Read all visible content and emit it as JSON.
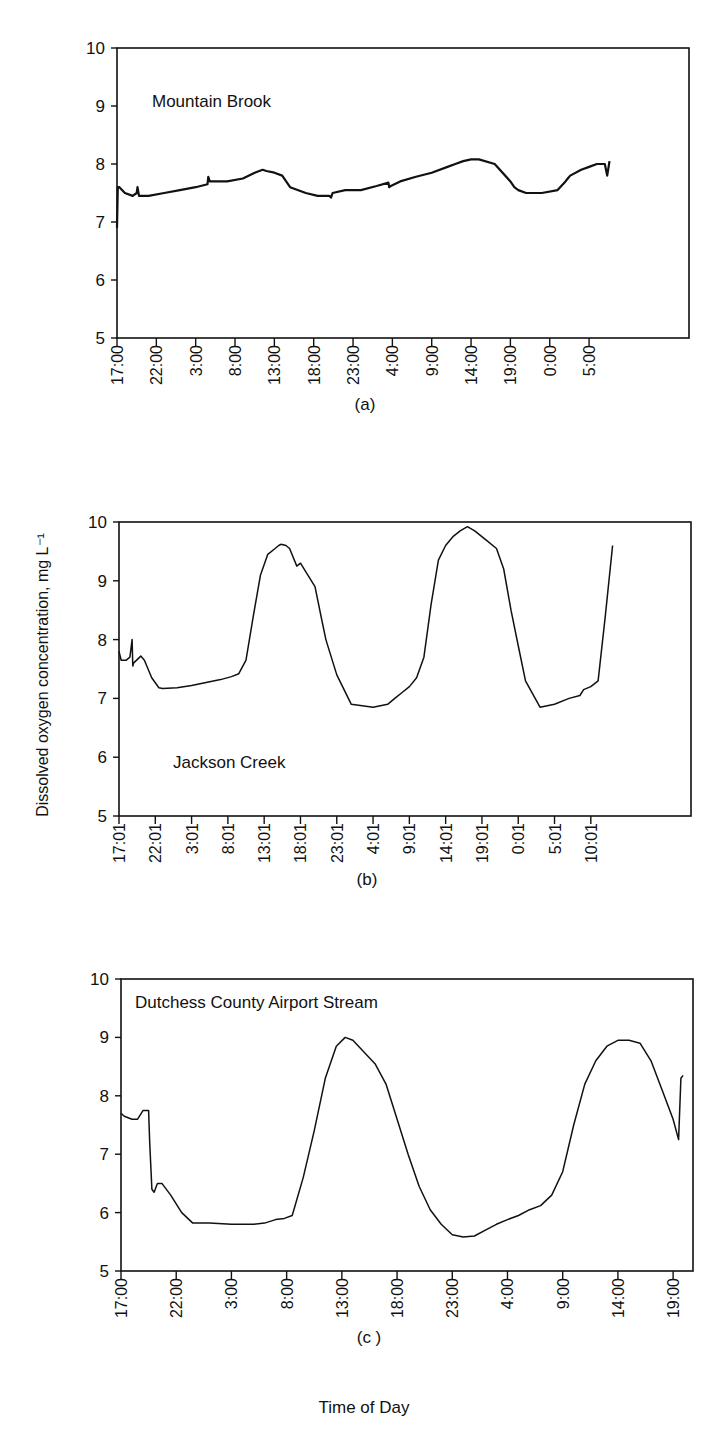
{
  "figure": {
    "y_axis_label": "Dissolved oxygen concentration, mg L⁻¹",
    "x_axis_label": "Time of Day"
  },
  "chart_data": [
    {
      "type": "line",
      "panel_label": "(a)",
      "title": "Mountain Brook",
      "xlabel": "",
      "ylabel": "Dissolved oxygen concentration, mg L⁻¹",
      "ylim": [
        5,
        10
      ],
      "yticks": [
        5,
        6,
        7,
        8,
        9,
        10
      ],
      "x_unit": "hours since 17:00",
      "xlim": [
        0,
        72.7
      ],
      "xtick_labels": [
        "17:00",
        "22:00",
        "3:00",
        "8:00",
        "13:00",
        "18:00",
        "23:00",
        "4:00",
        "9:00",
        "14:00",
        "19:00",
        "0:00",
        "5:00"
      ],
      "xtick_positions": [
        0,
        5,
        10,
        15,
        20,
        25,
        30,
        35,
        40,
        45,
        50,
        55,
        60
      ],
      "grid": false,
      "series": [
        {
          "name": "Mountain Brook",
          "x": [
            0,
            0.1,
            0.3,
            1,
            2,
            2.5,
            2.6,
            2.8,
            4,
            6,
            8,
            10,
            11.5,
            11.6,
            11.8,
            14,
            16,
            17.5,
            18.5,
            19,
            20,
            21,
            22,
            24,
            25.5,
            27,
            27.2,
            27.4,
            29,
            31,
            33,
            34.5,
            34.6,
            34.8,
            36,
            38,
            40,
            42,
            43,
            44,
            45,
            46,
            48,
            50,
            50.5,
            51,
            52,
            54,
            56,
            57,
            57.3,
            57.6,
            59,
            60,
            61,
            62,
            62.3,
            62.6
          ],
          "y": [
            6.9,
            7.6,
            7.6,
            7.5,
            7.45,
            7.5,
            7.6,
            7.45,
            7.45,
            7.5,
            7.55,
            7.6,
            7.65,
            7.78,
            7.7,
            7.7,
            7.75,
            7.85,
            7.9,
            7.88,
            7.85,
            7.8,
            7.6,
            7.5,
            7.45,
            7.45,
            7.42,
            7.5,
            7.55,
            7.55,
            7.62,
            7.68,
            7.6,
            7.62,
            7.7,
            7.78,
            7.85,
            7.95,
            8.0,
            8.05,
            8.08,
            8.08,
            8.0,
            7.7,
            7.6,
            7.55,
            7.5,
            7.5,
            7.55,
            7.7,
            7.75,
            7.8,
            7.9,
            7.95,
            8.0,
            8.0,
            7.8,
            8.05,
            8.1,
            8.15,
            8.2,
            8.15,
            8.15,
            8.15,
            8.2,
            8.75
          ]
        }
      ]
    },
    {
      "type": "line",
      "panel_label": "(b)",
      "title": "Jackson Creek",
      "xlabel": "",
      "ylabel": "Dissolved oxygen concentration, mg L⁻¹",
      "ylim": [
        5,
        10
      ],
      "yticks": [
        5,
        6,
        7,
        8,
        9,
        10
      ],
      "x_unit": "hours since 17:01",
      "xlim": [
        0,
        78.8
      ],
      "xtick_labels": [
        "17:01",
        "22:01",
        "3:01",
        "8:01",
        "13:01",
        "18:01",
        "23:01",
        "4:01",
        "9:01",
        "14:01",
        "19:01",
        "0:01",
        "5:01",
        "10:01"
      ],
      "xtick_positions": [
        0,
        5,
        10,
        15,
        20,
        25,
        30,
        35,
        40,
        45,
        50,
        55,
        60,
        65
      ],
      "grid": false,
      "series": [
        {
          "name": "Jackson Creek",
          "x": [
            0,
            0.3,
            1,
            1.5,
            1.8,
            1.9,
            2,
            3,
            3.5,
            4.5,
            5.5,
            6,
            8,
            10,
            12,
            14,
            15.5,
            16.5,
            17.5,
            18.5,
            19.5,
            20.5,
            21.5,
            22,
            22.3,
            23,
            23.5,
            24.5,
            25,
            26,
            27,
            28,
            28.5,
            29,
            30,
            32,
            35,
            37,
            38,
            39,
            40,
            41,
            42,
            43,
            44,
            45,
            46,
            47,
            48,
            49,
            50.5,
            52,
            53,
            54,
            55,
            56,
            58,
            60,
            62,
            63.5,
            64,
            65,
            66,
            67,
            68
          ],
          "y": [
            7.8,
            7.65,
            7.65,
            7.7,
            8.0,
            7.55,
            7.6,
            7.72,
            7.65,
            7.35,
            7.18,
            7.17,
            7.18,
            7.22,
            7.27,
            7.32,
            7.37,
            7.42,
            7.65,
            8.4,
            9.1,
            9.45,
            9.55,
            9.6,
            9.62,
            9.6,
            9.55,
            9.25,
            9.3,
            9.1,
            8.9,
            8.3,
            8.0,
            7.8,
            7.4,
            6.9,
            6.85,
            6.9,
            7.0,
            7.1,
            7.2,
            7.35,
            7.7,
            8.6,
            9.35,
            9.6,
            9.75,
            9.85,
            9.92,
            9.85,
            9.7,
            9.55,
            9.2,
            8.5,
            7.9,
            7.3,
            6.85,
            6.9,
            7.0,
            7.05,
            7.15,
            7.2,
            7.3,
            8.4,
            9.6,
            10.0
          ]
        }
      ]
    },
    {
      "type": "line",
      "panel_label": "(c )",
      "title": "Dutchess County Airport Stream",
      "xlabel": "Time of Day",
      "ylabel": "Dissolved oxygen concentration, mg L⁻¹",
      "ylim": [
        5,
        10
      ],
      "yticks": [
        5,
        6,
        7,
        8,
        9,
        10
      ],
      "x_unit": "hours since 17:00",
      "xlim": [
        0,
        51.8
      ],
      "xtick_labels": [
        "17:00",
        "22:00",
        "3:00",
        "8:00",
        "13:00",
        "18:00",
        "23:00",
        "4:00",
        "9:00",
        "14:00",
        "19:00"
      ],
      "xtick_positions": [
        0,
        5,
        10,
        15,
        20,
        25,
        30,
        35,
        40,
        45,
        50
      ],
      "grid": false,
      "series": [
        {
          "name": "Dutchess County Airport Stream",
          "x": [
            0,
            0.3,
            1,
            1.5,
            2,
            2.5,
            2.6,
            2.8,
            3.0,
            3.3,
            3.7,
            4.5,
            5.5,
            6.5,
            8,
            10,
            12,
            13,
            14,
            14.8,
            15.5,
            16.5,
            17.5,
            18.5,
            19.5,
            20.3,
            21,
            22,
            23,
            24,
            25,
            26,
            27,
            28,
            29,
            30,
            31,
            32,
            33,
            34,
            35,
            36,
            37,
            38,
            39,
            40,
            41,
            42,
            43,
            44,
            45,
            46,
            47,
            48,
            49,
            50,
            50.5,
            50.7,
            50.9
          ],
          "y": [
            7.7,
            7.65,
            7.6,
            7.6,
            7.75,
            7.75,
            7.2,
            6.4,
            6.35,
            6.5,
            6.5,
            6.3,
            6.0,
            5.82,
            5.82,
            5.8,
            5.8,
            5.82,
            5.88,
            5.9,
            5.95,
            6.6,
            7.4,
            8.3,
            8.85,
            9.0,
            8.95,
            8.75,
            8.55,
            8.2,
            7.6,
            7.0,
            6.45,
            6.05,
            5.8,
            5.62,
            5.58,
            5.6,
            5.7,
            5.8,
            5.88,
            5.95,
            6.05,
            6.12,
            6.3,
            6.7,
            7.5,
            8.2,
            8.6,
            8.85,
            8.95,
            8.95,
            8.9,
            8.6,
            8.1,
            7.6,
            7.25,
            8.3,
            8.35
          ]
        }
      ]
    }
  ]
}
